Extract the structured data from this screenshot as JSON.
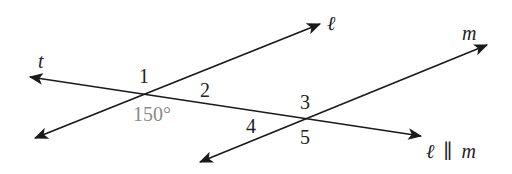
{
  "diagram": {
    "lines": {
      "transversal": {
        "label": "t"
      },
      "line_l": {
        "label": "ℓ"
      },
      "line_m": {
        "label": "m"
      }
    },
    "angles": {
      "a1": "1",
      "a2": "2",
      "a3": "3",
      "a4": "4",
      "a5": "5",
      "given": "150°"
    },
    "statement": {
      "left": "ℓ",
      "symbol": "∥",
      "right": "m"
    },
    "colors": {
      "line": "#1a1a1a",
      "text": "#222222",
      "given_angle": "#8a8a8a",
      "background": "#ffffff"
    }
  }
}
